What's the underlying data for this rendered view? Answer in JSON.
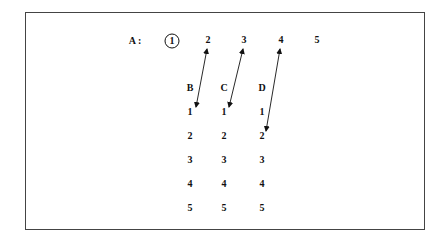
{
  "row_a": {
    "label": "A :",
    "items": [
      "1",
      "2",
      "3",
      "4",
      "5"
    ],
    "circled_index": 0
  },
  "columns": [
    {
      "label": "B",
      "items": [
        "1",
        "2",
        "3",
        "4",
        "5"
      ]
    },
    {
      "label": "C",
      "items": [
        "1",
        "2",
        "3",
        "4",
        "5"
      ]
    },
    {
      "label": "D",
      "items": [
        "1",
        "2",
        "3",
        "4",
        "5"
      ]
    }
  ],
  "arrows": [
    {
      "from": "A2",
      "to": "B1"
    },
    {
      "from": "A3",
      "to": "C1"
    },
    {
      "from": "A4",
      "to": "D2"
    }
  ]
}
